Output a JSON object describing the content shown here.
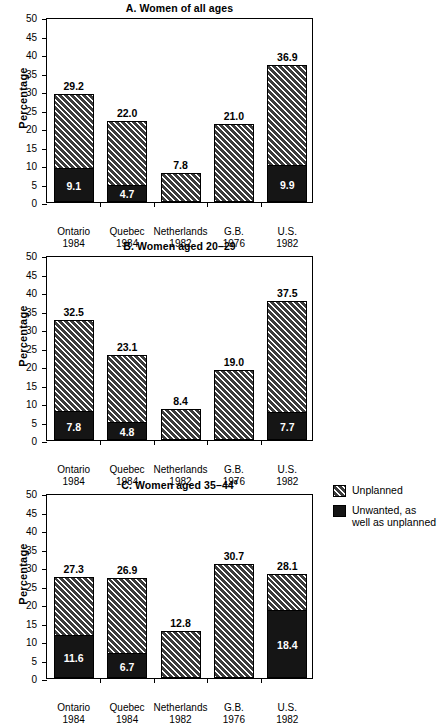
{
  "figure": {
    "ylabel": "Percentage",
    "yticks": [
      "0",
      "5",
      "10",
      "15",
      "20",
      "25",
      "30",
      "35",
      "40",
      "45",
      "50"
    ],
    "ylim": [
      0,
      50
    ],
    "legend": {
      "items": [
        {
          "key": "unplanned",
          "label": "Unplanned",
          "swatch": "hatch-diagonal-swatch",
          "color": "#4a4a4a"
        },
        {
          "key": "unwanted",
          "label": "Unwanted, as\nwell as unplanned",
          "line1": "Unwanted, as",
          "line2": "well as unplanned",
          "swatch": "solid-black-swatch",
          "color": "#151515"
        }
      ]
    },
    "categories": [
      {
        "name": "Ontario",
        "year": "1984"
      },
      {
        "name": "Quebec",
        "year": "1984"
      },
      {
        "name": "Netherlands",
        "year": "1982"
      },
      {
        "name": "G.B.",
        "year": "1976"
      },
      {
        "name": "U.S.",
        "year": "1982"
      }
    ]
  },
  "chart_data": [
    {
      "type": "bar",
      "panel": "A",
      "title": "A. Women of all ages",
      "title_main": "A. Women of all ages",
      "title_sup": "",
      "xlabel": "",
      "ylabel": "Percentage",
      "ylim": [
        0,
        50
      ],
      "yticks": [
        0,
        5,
        10,
        15,
        20,
        25,
        30,
        35,
        40,
        45,
        50
      ],
      "grid": false,
      "legend_position": "outside-right",
      "categories": [
        "Ontario 1984",
        "Quebec 1984",
        "Netherlands 1982",
        "G.B. 1976",
        "U.S. 1982"
      ],
      "series": [
        {
          "name": "Unplanned",
          "values": [
            29.2,
            22.0,
            7.8,
            21.0,
            36.9
          ]
        },
        {
          "name": "Unwanted, as well as unplanned",
          "values": [
            9.1,
            4.7,
            null,
            null,
            9.9
          ]
        }
      ],
      "labels_total": [
        "29.2",
        "22.0",
        "7.8",
        "21.0",
        "36.9"
      ],
      "labels_inner": [
        "9.1",
        "4.7",
        "",
        "",
        "9.9"
      ]
    },
    {
      "type": "bar",
      "panel": "B",
      "title": "B. Women aged 20–29",
      "title_main": "B. Women aged 20–29",
      "title_sup": "",
      "xlabel": "",
      "ylabel": "Percentage",
      "ylim": [
        0,
        50
      ],
      "yticks": [
        0,
        5,
        10,
        15,
        20,
        25,
        30,
        35,
        40,
        45,
        50
      ],
      "grid": false,
      "legend_position": "outside-right",
      "categories": [
        "Ontario 1984",
        "Quebec 1984",
        "Netherlands 1982",
        "G.B. 1976",
        "U.S. 1982"
      ],
      "series": [
        {
          "name": "Unplanned",
          "values": [
            32.5,
            23.1,
            8.4,
            19.0,
            37.5
          ]
        },
        {
          "name": "Unwanted, as well as unplanned",
          "values": [
            7.8,
            4.8,
            null,
            null,
            7.7
          ]
        }
      ],
      "labels_total": [
        "32.5",
        "23.1",
        "8.4",
        "19.0",
        "37.5"
      ],
      "labels_inner": [
        "7.8",
        "4.8",
        "",
        "",
        "7.7"
      ]
    },
    {
      "type": "bar",
      "panel": "C",
      "title": "C. Women aged 35–44 a",
      "title_main": "C. Women aged 35–44",
      "title_sup": "a",
      "xlabel": "",
      "ylabel": "Percentage",
      "ylim": [
        0,
        50
      ],
      "yticks": [
        0,
        5,
        10,
        15,
        20,
        25,
        30,
        35,
        40,
        45,
        50
      ],
      "grid": false,
      "legend_position": "outside-right",
      "categories": [
        "Ontario 1984",
        "Quebec 1984",
        "Netherlands 1982",
        "G.B. 1976",
        "U.S. 1982"
      ],
      "series": [
        {
          "name": "Unplanned",
          "values": [
            27.3,
            26.9,
            12.8,
            30.7,
            28.1
          ]
        },
        {
          "name": "Unwanted, as well as unplanned",
          "values": [
            11.6,
            6.7,
            null,
            null,
            18.4
          ]
        }
      ],
      "labels_total": [
        "27.3",
        "26.9",
        "12.8",
        "30.7",
        "28.1"
      ],
      "labels_inner": [
        "11.6",
        "6.7",
        "",
        "",
        "18.4"
      ]
    }
  ]
}
